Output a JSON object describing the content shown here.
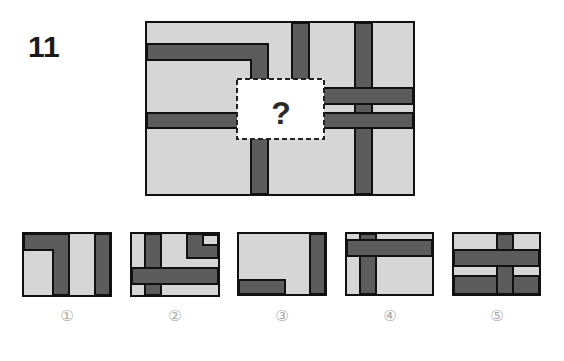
{
  "question": {
    "number": "11",
    "missing_mark": "?"
  },
  "colors": {
    "background_fill": "#d6d6d6",
    "bar_fill": "#5c5c5c",
    "outline": "#111111",
    "missing_box_fill": "#ffffff",
    "option_label": "#aaaaaa"
  },
  "options": [
    {
      "label": "①",
      "id": "1"
    },
    {
      "label": "②",
      "id": "2"
    },
    {
      "label": "③",
      "id": "3"
    },
    {
      "label": "④",
      "id": "4"
    },
    {
      "label": "⑤",
      "id": "5"
    }
  ]
}
